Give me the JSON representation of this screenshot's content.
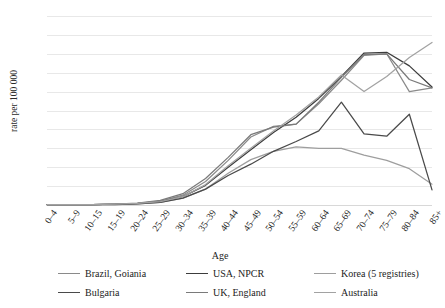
{
  "chart_data": {
    "type": "line",
    "title": "",
    "xlabel": "Age",
    "ylabel": "rate per 100 000",
    "ylim": [
      0,
      500
    ],
    "ytick_step": 50,
    "yticks": [
      500,
      450,
      400,
      350,
      300,
      250,
      200,
      150,
      100,
      50,
      0
    ],
    "grid": "horizontal",
    "legend_position": "bottom",
    "categories": [
      "0–4",
      "5–9",
      "10–15",
      "15–19",
      "20–24",
      "25–29",
      "30–34",
      "35–39",
      "40–44",
      "45–49",
      "50–54",
      "55–59",
      "60–64",
      "65–69",
      "70–74",
      "75–79",
      "80–84",
      "85+"
    ],
    "series": [
      {
        "name": "Brazil, Goiania",
        "color": "#8a8a8a",
        "values": [
          1,
          1,
          1,
          2,
          4,
          10,
          26,
          62,
          118,
          180,
          208,
          214,
          268,
          330,
          396,
          400,
          300,
          310
        ]
      },
      {
        "name": "USA, NPCR",
        "color": "#3c3c3c",
        "values": [
          1,
          1,
          1,
          2,
          4,
          9,
          22,
          52,
          100,
          146,
          192,
          232,
          282,
          340,
          402,
          404,
          368,
          312
        ]
      },
      {
        "name": "Korea (5 registries)",
        "color": "#9e9e9e",
        "values": [
          1,
          1,
          1,
          2,
          3,
          7,
          18,
          42,
          84,
          120,
          142,
          154,
          150,
          150,
          132,
          118,
          96,
          55
        ]
      },
      {
        "name": "Bulgaria",
        "color": "#4a4a4a",
        "values": [
          1,
          1,
          1,
          1,
          3,
          7,
          18,
          42,
          78,
          108,
          142,
          168,
          196,
          272,
          188,
          182,
          240,
          40
        ]
      },
      {
        "name": "UK, England",
        "color": "#7a7a7a",
        "values": [
          1,
          1,
          1,
          2,
          5,
          12,
          30,
          70,
          126,
          186,
          206,
          214,
          272,
          338,
          398,
          400,
          332,
          310
        ]
      },
      {
        "name": "Australia",
        "color": "#a2a2a2",
        "values": [
          1,
          1,
          1,
          2,
          4,
          9,
          22,
          54,
          104,
          150,
          196,
          238,
          286,
          344,
          300,
          340,
          390,
          430
        ]
      }
    ]
  },
  "legend": {
    "items": [
      {
        "label": "Brazil, Goiania"
      },
      {
        "label": "USA, NPCR"
      },
      {
        "label": "Korea (5 registries)"
      },
      {
        "label": "Bulgaria"
      },
      {
        "label": "UK, England"
      },
      {
        "label": "Australia"
      }
    ]
  }
}
